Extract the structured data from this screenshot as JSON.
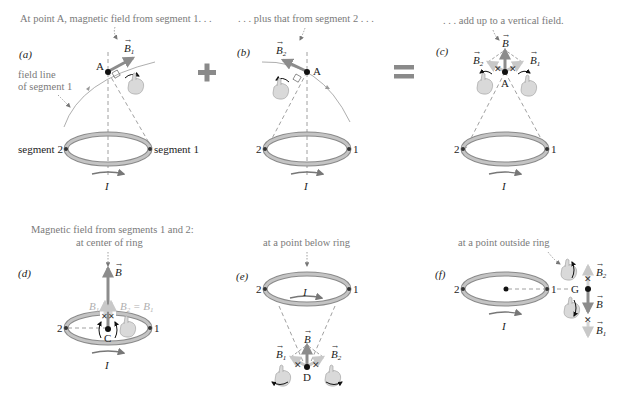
{
  "colors": {
    "caption": "#7a7a7a",
    "ring": "#b8b8b8",
    "ring_edge": "#8a8a8a",
    "field_vector": "#8c8c8c",
    "component_vector": "#c8c8c8",
    "operator": "#8a8a8a",
    "text": "#222222"
  },
  "panels": {
    "a": {
      "label": "(a)",
      "caption": "At point A, magnetic field from segment 1. . .",
      "point": "A",
      "vector": "B",
      "vector_sub": "1",
      "field_line_label_1": "field line",
      "field_line_label_2": "of segment 1",
      "seg_left": "segment 2",
      "seg_right": "segment 1",
      "current": "I"
    },
    "b": {
      "label": "(b)",
      "caption": ". . . plus that from segment 2 . . .",
      "point": "A",
      "vector": "B",
      "vector_sub": "2",
      "seg_left": "2",
      "seg_right": "1",
      "current": "I"
    },
    "c": {
      "label": "(c)",
      "caption": ". . . add up to a vertical field.",
      "point": "A",
      "vector": "B",
      "b1": "B",
      "b1_sub": "1",
      "b2": "B",
      "b2_sub": "2",
      "seg_left": "2",
      "seg_right": "1",
      "current": "I"
    },
    "d": {
      "label": "(d)",
      "caption_1": "Magnetic field from segments 1 and 2:",
      "caption_2": "at center of ring",
      "point": "C",
      "vector": "B",
      "b1": "B",
      "b1_sub": "1",
      "b2_eq": "B",
      "b2_eq_sub": "2",
      "equals": " = ",
      "b2_eq_rhs": "B",
      "b2_eq_rhs_sub": "1",
      "seg_left": "2",
      "seg_right": "1",
      "current": "I"
    },
    "e": {
      "label": "(e)",
      "caption": "at a point below ring",
      "point": "D",
      "vector": "B",
      "b1": "B",
      "b1_sub": "1",
      "b2": "B",
      "b2_sub": "2",
      "seg_left": "2",
      "seg_right": "1",
      "current": "I"
    },
    "f": {
      "label": "(f)",
      "caption": "at a point outside ring",
      "point": "G",
      "vector": "B",
      "b1": "B",
      "b1_sub": "1",
      "b2": "B",
      "b2_sub": "2",
      "seg_left": "2",
      "seg_right": "1",
      "current": "I"
    }
  },
  "operators": {
    "plus": "+",
    "equals": "="
  }
}
